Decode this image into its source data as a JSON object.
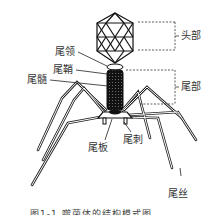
{
  "figure": {
    "labels": {
      "head": "头部",
      "tail": "尾部",
      "collar": "尾领",
      "sheath": "尾鞘",
      "core": "尾髓",
      "baseplate": "尾板",
      "spike": "尾刺",
      "fiber": "尾丝"
    },
    "caption": "图1-1  噬菌体的结构模式图"
  }
}
